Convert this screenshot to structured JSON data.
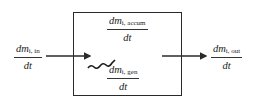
{
  "diagram": {
    "type": "mass-balance control volume",
    "inlet": {
      "numerator": "dm",
      "subscript": "i, in",
      "denominator": "dt"
    },
    "accumulation": {
      "numerator": "dm",
      "subscript": "i, accum",
      "denominator": "dt"
    },
    "generation": {
      "numerator": "dm",
      "subscript": "i, gen",
      "denominator": "dt"
    },
    "outlet": {
      "numerator": "dm",
      "subscript": "i, out",
      "denominator": "dt"
    },
    "colors": {
      "line": "#2a2a2a",
      "background": "#ffffff"
    }
  }
}
